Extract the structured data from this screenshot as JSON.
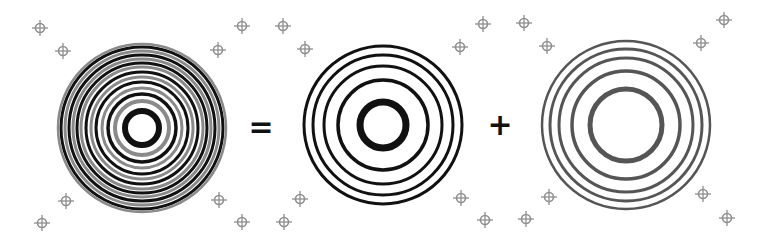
{
  "figure": {
    "equation": [
      "pattern-combined",
      "=",
      "pattern-a",
      "+",
      "pattern-b"
    ],
    "operators": [
      {
        "symbol": "=",
        "x": 261,
        "y": 127
      },
      {
        "symbol": "+",
        "x": 500,
        "y": 125
      }
    ],
    "colors": {
      "background": "#ffffff",
      "combined_dark": "#111111",
      "combined_grey": "#8a8a8a",
      "pattern_a": "#111111",
      "pattern_b": "#555555",
      "marker": "#8f8f8f",
      "operator": "#111111"
    },
    "patterns": [
      {
        "name": "combined-pattern",
        "cx": 142,
        "cy": 128,
        "rings": [
          {
            "r": 17,
            "w": 6,
            "c": "#111111"
          },
          {
            "r": 27,
            "w": 4,
            "c": "#8a8a8a"
          },
          {
            "r": 34,
            "w": 3.5,
            "c": "#111111"
          },
          {
            "r": 40,
            "w": 3,
            "c": "#8a8a8a"
          },
          {
            "r": 46,
            "w": 3,
            "c": "#111111"
          },
          {
            "r": 51,
            "w": 3,
            "c": "#8a8a8a"
          },
          {
            "r": 56,
            "w": 3,
            "c": "#111111"
          },
          {
            "r": 61,
            "w": 3,
            "c": "#8a8a8a"
          },
          {
            "r": 65,
            "w": 3,
            "c": "#111111"
          },
          {
            "r": 69,
            "w": 3,
            "c": "#8a8a8a"
          },
          {
            "r": 73,
            "w": 3,
            "c": "#111111"
          },
          {
            "r": 77,
            "w": 3,
            "c": "#8a8a8a"
          },
          {
            "r": 81,
            "w": 3,
            "c": "#111111"
          },
          {
            "r": 84,
            "w": 2.5,
            "c": "#8a8a8a"
          }
        ]
      },
      {
        "name": "pattern-a",
        "cx": 383,
        "cy": 125,
        "rings": [
          {
            "r": 23,
            "w": 7,
            "c": "#111111"
          },
          {
            "r": 45,
            "w": 3.5,
            "c": "#111111"
          },
          {
            "r": 59,
            "w": 3,
            "c": "#111111"
          },
          {
            "r": 70,
            "w": 3,
            "c": "#111111"
          },
          {
            "r": 79,
            "w": 3,
            "c": "#111111"
          }
        ]
      },
      {
        "name": "pattern-b",
        "cx": 626,
        "cy": 125,
        "rings": [
          {
            "r": 36,
            "w": 5,
            "c": "#555555"
          },
          {
            "r": 54,
            "w": 3.5,
            "c": "#555555"
          },
          {
            "r": 67,
            "w": 3,
            "c": "#555555"
          },
          {
            "r": 76,
            "w": 3,
            "c": "#555555"
          },
          {
            "r": 84,
            "w": 2.5,
            "c": "#555555"
          }
        ]
      }
    ],
    "markers": [
      {
        "x": 40,
        "y": 28
      },
      {
        "x": 63,
        "y": 51
      },
      {
        "x": 242,
        "y": 26
      },
      {
        "x": 218,
        "y": 50
      },
      {
        "x": 66,
        "y": 201
      },
      {
        "x": 42,
        "y": 223
      },
      {
        "x": 219,
        "y": 200
      },
      {
        "x": 242,
        "y": 222
      },
      {
        "x": 283,
        "y": 26
      },
      {
        "x": 305,
        "y": 49
      },
      {
        "x": 483,
        "y": 24
      },
      {
        "x": 460,
        "y": 47
      },
      {
        "x": 300,
        "y": 199
      },
      {
        "x": 284,
        "y": 222
      },
      {
        "x": 461,
        "y": 198
      },
      {
        "x": 485,
        "y": 220
      },
      {
        "x": 524,
        "y": 23
      },
      {
        "x": 547,
        "y": 46
      },
      {
        "x": 724,
        "y": 20
      },
      {
        "x": 701,
        "y": 43
      },
      {
        "x": 549,
        "y": 197
      },
      {
        "x": 526,
        "y": 219
      },
      {
        "x": 703,
        "y": 194
      },
      {
        "x": 727,
        "y": 218
      }
    ]
  }
}
